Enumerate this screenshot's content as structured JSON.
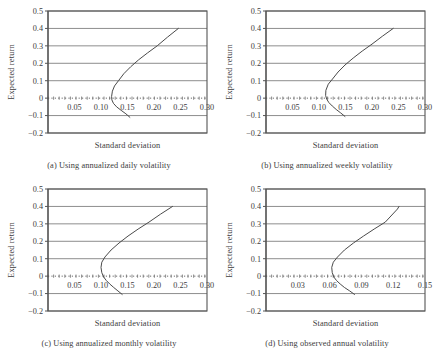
{
  "figure": {
    "panels": [
      {
        "key": "a",
        "caption": "(a) Using annualized daily volatility",
        "xlabel": "Standard deviation",
        "ylabel": "Expected return"
      },
      {
        "key": "b",
        "caption": "(b) Using annualized weekly volatility",
        "xlabel": "Standard deviation",
        "ylabel": "Expected return"
      },
      {
        "key": "c",
        "caption": "(c) Using annualized monthly volatility",
        "xlabel": "Standard deviation",
        "ylabel": "Expected return"
      },
      {
        "key": "d",
        "caption": "(d) Using observed annual volatility",
        "xlabel": "Standard deviation",
        "ylabel": "Expected return"
      }
    ]
  },
  "chart_data": [
    {
      "type": "line",
      "title": "(a) Using annualized daily volatility",
      "xlabel": "Standard deviation",
      "ylabel": "Expected return",
      "xlim": [
        0.0,
        0.3
      ],
      "ylim": [
        -0.2,
        0.5
      ],
      "xticks": [
        0.05,
        0.1,
        0.15,
        0.2,
        0.25,
        0.3
      ],
      "xtick_labels": [
        "0.05",
        "0.10",
        "0.15",
        "0.20",
        "0.25",
        "0.30"
      ],
      "yticks": [
        -0.2,
        -0.1,
        0,
        0.1,
        0.2,
        0.3,
        0.4,
        0.5
      ],
      "ytick_labels": [
        "-0.2",
        "-0.1",
        "0",
        "0.1",
        "0.2",
        "0.3",
        "0.4",
        "0.5"
      ],
      "grid": true,
      "legend": "none",
      "zero_line": true,
      "series": [
        {
          "name": "efficient frontier",
          "x": [
            0.1545,
            0.147,
            0.138,
            0.1295,
            0.1235,
            0.1205,
            0.12,
            0.1215,
            0.1255,
            0.133,
            0.143,
            0.156,
            0.171,
            0.188,
            0.206,
            0.2255,
            0.246
          ],
          "y": [
            -0.11,
            -0.09,
            -0.07,
            -0.05,
            -0.03,
            -0.01,
            0.01,
            0.04,
            0.07,
            0.1,
            0.14,
            0.18,
            0.22,
            0.26,
            0.3,
            0.35,
            0.4
          ]
        }
      ]
    },
    {
      "type": "line",
      "title": "(b) Using annualized weekly volatility",
      "xlabel": "Standard deviation",
      "ylabel": "Expected return",
      "xlim": [
        0.0,
        0.3
      ],
      "ylim": [
        -0.2,
        0.5
      ],
      "xticks": [
        0.05,
        0.1,
        0.15,
        0.2,
        0.25,
        0.3
      ],
      "xtick_labels": [
        "0.05",
        "0.10",
        "0.15",
        "0.20",
        "0.25",
        "0.30"
      ],
      "yticks": [
        -0.2,
        -0.1,
        0,
        0.1,
        0.2,
        0.3,
        0.4,
        0.5
      ],
      "ytick_labels": [
        "-0.2",
        "-0.1",
        "0",
        "0.1",
        "0.2",
        "0.3",
        "0.4",
        "0.5"
      ],
      "grid": true,
      "legend": "none",
      "zero_line": true,
      "series": [
        {
          "name": "efficient frontier",
          "x": [
            0.149,
            0.141,
            0.1325,
            0.125,
            0.1185,
            0.1145,
            0.1125,
            0.113,
            0.1175,
            0.1255,
            0.136,
            0.149,
            0.1645,
            0.1815,
            0.2,
            0.2195,
            0.24
          ],
          "y": [
            -0.105,
            -0.085,
            -0.065,
            -0.045,
            -0.025,
            -0.005,
            0.015,
            0.045,
            0.08,
            0.11,
            0.15,
            0.19,
            0.23,
            0.27,
            0.31,
            0.355,
            0.4
          ]
        }
      ]
    },
    {
      "type": "line",
      "title": "(c) Using annualized monthly volatility",
      "xlabel": "Standard deviation",
      "ylabel": "Expected return",
      "xlim": [
        0.0,
        0.3
      ],
      "ylim": [
        -0.2,
        0.5
      ],
      "xticks": [
        0.05,
        0.1,
        0.15,
        0.2,
        0.25,
        0.3
      ],
      "xtick_labels": [
        "0.05",
        "0.10",
        "0.15",
        "0.20",
        "0.25",
        "0.30"
      ],
      "yticks": [
        -0.2,
        -0.1,
        0,
        0.1,
        0.2,
        0.3,
        0.4,
        0.5
      ],
      "ytick_labels": [
        "-0.2",
        "-0.1",
        "0",
        "0.1",
        "0.2",
        "0.3",
        "0.4",
        "0.5"
      ],
      "grid": true,
      "legend": "none",
      "zero_line": true,
      "series": [
        {
          "name": "efficient frontier",
          "x": [
            0.14,
            0.132,
            0.124,
            0.1165,
            0.11,
            0.105,
            0.1015,
            0.1,
            0.1015,
            0.1075,
            0.119,
            0.134,
            0.151,
            0.17,
            0.1905,
            0.212,
            0.235
          ],
          "y": [
            -0.105,
            -0.085,
            -0.065,
            -0.045,
            -0.025,
            -0.005,
            0.02,
            0.05,
            0.08,
            0.11,
            0.15,
            0.19,
            0.23,
            0.27,
            0.31,
            0.355,
            0.4
          ]
        }
      ]
    },
    {
      "type": "line",
      "title": "(d) Using observed annual volatility",
      "xlabel": "Standard deviation",
      "ylabel": "Expected return",
      "xlim": [
        0.0,
        0.15
      ],
      "ylim": [
        -0.2,
        0.5
      ],
      "xticks": [
        0.03,
        0.06,
        0.09,
        0.12,
        0.15
      ],
      "xtick_labels": [
        "0.03",
        "0.06",
        "0.09",
        "0.12",
        "0.15"
      ],
      "yticks": [
        -0.2,
        -0.1,
        0,
        0.1,
        0.2,
        0.3,
        0.4,
        0.5
      ],
      "ytick_labels": [
        "-0.2",
        "-0.1",
        "0",
        "0.1",
        "0.2",
        "0.3",
        "0.4",
        "0.5"
      ],
      "grid": true,
      "legend": "none",
      "zero_line": true,
      "series": [
        {
          "name": "efficient frontier",
          "x": [
            0.0835,
            0.079,
            0.074,
            0.07,
            0.0665,
            0.064,
            0.0625,
            0.062,
            0.0635,
            0.0675,
            0.074,
            0.0825,
            0.092,
            0.102,
            0.1125,
            0.124,
            0.1255
          ],
          "y": [
            -0.105,
            -0.085,
            -0.065,
            -0.045,
            -0.025,
            -0.005,
            0.02,
            0.05,
            0.08,
            0.11,
            0.15,
            0.19,
            0.23,
            0.27,
            0.31,
            0.385,
            0.4
          ]
        }
      ]
    }
  ]
}
